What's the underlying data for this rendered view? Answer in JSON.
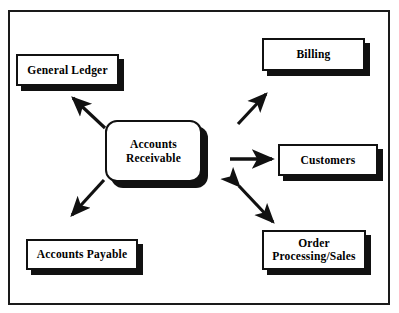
{
  "diagram": {
    "type": "context-flow-diagram",
    "frame": {
      "visible": true,
      "border_color": "#1a1a1a"
    },
    "colors": {
      "box_fill": "#ffffff",
      "box_border": "#111111",
      "shadow": "#111111",
      "arrow": "#111111",
      "text": "#000000",
      "frame_border": "#1a1a1a"
    },
    "center_node": {
      "id": "accounts-receivable",
      "label": "Accounts\nReceivable",
      "shape": "rounded-rectangle",
      "has_shadow": true
    },
    "nodes": [
      {
        "id": "general-ledger",
        "label": "General Ledger",
        "shape": "rectangle",
        "position": "top-left",
        "has_shadow": true
      },
      {
        "id": "billing",
        "label": "Billing",
        "shape": "rectangle",
        "position": "top-right",
        "has_shadow": true
      },
      {
        "id": "customers",
        "label": "Customers",
        "shape": "rectangle",
        "position": "middle-right",
        "has_shadow": true
      },
      {
        "id": "order-processing-sales",
        "label": "Order\nProcessing/Sales",
        "shape": "rectangle",
        "position": "bottom-right",
        "has_shadow": true
      },
      {
        "id": "accounts-payable",
        "label": "Accounts Payable",
        "shape": "rectangle",
        "position": "bottom-left",
        "has_shadow": true
      }
    ],
    "arrows": [
      {
        "id": "ar-to-general-ledger",
        "from": "accounts-receivable",
        "to": "general-ledger",
        "direction": "single",
        "heads": "end",
        "orientation": "up-left"
      },
      {
        "id": "ar-to-accounts-payable",
        "from": "accounts-receivable",
        "to": "accounts-payable",
        "direction": "single",
        "heads": "end",
        "orientation": "down-left"
      },
      {
        "id": "ar-to-billing",
        "from": "accounts-receivable",
        "to": "billing",
        "direction": "single",
        "heads": "end",
        "orientation": "up-right"
      },
      {
        "id": "ar-to-customers",
        "from": "accounts-receivable",
        "to": "customers",
        "direction": "single",
        "heads": "end",
        "orientation": "right"
      },
      {
        "id": "ar-to-order-processing",
        "from": "accounts-receivable",
        "to": "order-processing-sales",
        "direction": "double",
        "heads": "both",
        "orientation": "down-right"
      }
    ]
  }
}
